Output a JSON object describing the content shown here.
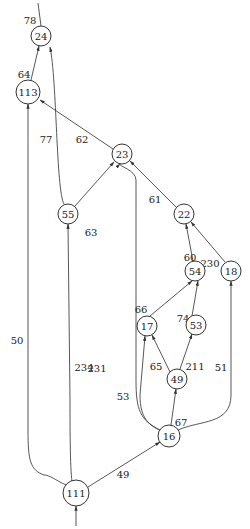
{
  "diagram": {
    "type": "directed-graph",
    "nodes": [
      {
        "id": "24",
        "label": "24"
      },
      {
        "id": "113",
        "label": "113"
      },
      {
        "id": "23",
        "label": "23"
      },
      {
        "id": "55",
        "label": "55"
      },
      {
        "id": "22",
        "label": "22"
      },
      {
        "id": "54",
        "label": "54"
      },
      {
        "id": "18",
        "label": "18"
      },
      {
        "id": "17",
        "label": "17"
      },
      {
        "id": "53",
        "label": "53"
      },
      {
        "id": "49",
        "label": "49"
      },
      {
        "id": "16",
        "label": "16"
      },
      {
        "id": "111",
        "label": "111"
      }
    ],
    "edges": [
      {
        "from": "24",
        "to": null,
        "label": "78"
      },
      {
        "from": "113",
        "to": "24",
        "label": "64"
      },
      {
        "from": "55",
        "to": "24",
        "label": "77"
      },
      {
        "from": "23",
        "to": "113",
        "label": "62"
      },
      {
        "from": "55",
        "to": "23",
        "label": "63"
      },
      {
        "from": "22",
        "to": "23",
        "label": "61"
      },
      {
        "from": "54",
        "to": "22",
        "label": "60"
      },
      {
        "from": "18",
        "to": "22",
        "label": "230"
      },
      {
        "from": "16",
        "to": "23",
        "label": "231"
      },
      {
        "from": "17",
        "to": "54",
        "label": "66"
      },
      {
        "from": "53",
        "to": "54",
        "label": "74"
      },
      {
        "from": "49",
        "to": "17",
        "label": "65"
      },
      {
        "from": "49",
        "to": "53",
        "label": "211"
      },
      {
        "from": "16",
        "to": "18",
        "label": "51"
      },
      {
        "from": "16",
        "to": "17",
        "label": "53"
      },
      {
        "from": "16",
        "to": "49",
        "label": "67"
      },
      {
        "from": "111",
        "to": "113",
        "label": "50"
      },
      {
        "from": "111",
        "to": "55",
        "label": "234"
      },
      {
        "from": "111",
        "to": "16",
        "label": "49"
      },
      {
        "from": null,
        "to": "111",
        "label": ""
      }
    ]
  }
}
